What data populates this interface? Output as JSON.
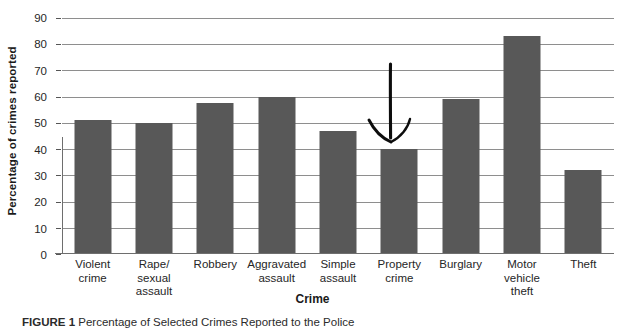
{
  "chart_data": {
    "type": "bar",
    "title": "",
    "xlabel": "Crime",
    "ylabel": "Percentage of crimes reported",
    "ylim": [
      0,
      90
    ],
    "yticks": [
      0,
      10,
      20,
      30,
      40,
      50,
      60,
      70,
      80,
      90
    ],
    "grid": true,
    "legend": "none",
    "bar_color": "#585858",
    "categories": [
      "Violent crime",
      "Rape/ sexual assault",
      "Robbery",
      "Aggravated assault",
      "Simple assault",
      "Property crime",
      "Burglary",
      "Motor vehicle theft",
      "Theft"
    ],
    "category_lines": [
      [
        "Violent",
        "crime"
      ],
      [
        "Rape/",
        "sexual",
        "assault"
      ],
      [
        "Robbery"
      ],
      [
        "Aggravated",
        "assault"
      ],
      [
        "Simple",
        "assault"
      ],
      [
        "Property",
        "crime"
      ],
      [
        "Burglary"
      ],
      [
        "Motor",
        "vehicle",
        "theft"
      ],
      [
        "Theft"
      ]
    ],
    "values": [
      51,
      50,
      57.5,
      60,
      47,
      40,
      59,
      83,
      32
    ],
    "annotations": [
      {
        "type": "arrow",
        "shape": "hand-drawn-down-arrow",
        "points_to": "Property crime",
        "color": "#000000"
      }
    ]
  },
  "figure": {
    "caption_label": "FIGURE 1",
    "caption_text": "Percentage of Selected Crimes Reported to the Police"
  }
}
